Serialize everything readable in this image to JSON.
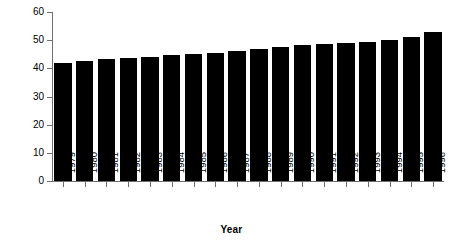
{
  "chart_data": {
    "type": "bar",
    "title": "",
    "xlabel": "Year",
    "ylabel": "Per cent",
    "categories": [
      "1979",
      "1980",
      "1981",
      "1982",
      "1983",
      "1984",
      "1985",
      "1986",
      "1987",
      "1988",
      "1989",
      "1990",
      "1991",
      "1992",
      "1993",
      "1994",
      "1995",
      "1996"
    ],
    "values": [
      41.8,
      42.5,
      43.2,
      43.7,
      44.2,
      44.7,
      45.1,
      45.4,
      46.3,
      46.8,
      47.6,
      48.2,
      48.6,
      49.1,
      49.5,
      50.2,
      51.0,
      53.0
    ],
    "ylim": [
      0,
      60
    ],
    "yticks": [
      0,
      10,
      20,
      30,
      40,
      50,
      60
    ],
    "ytick_labels": [
      "0",
      "10",
      "20",
      "30",
      "40",
      "50",
      "60"
    ],
    "grid": false,
    "legend": "none",
    "bar_color": "#000000",
    "axis_color": "#6f6f6f",
    "background_color": "#ffffff"
  },
  "axes": {
    "y_title": "Per cent",
    "x_title": "Year"
  }
}
